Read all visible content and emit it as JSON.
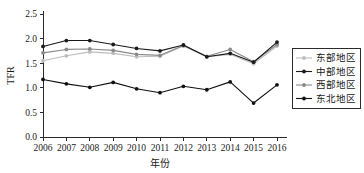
{
  "chart_data": {
    "type": "line",
    "title": "",
    "xlabel": "年份",
    "ylabel": "TFR",
    "x": [
      "2006",
      "2007",
      "2008",
      "2009",
      "2010",
      "2011",
      "2012",
      "2013",
      "2014",
      "2015",
      "2016"
    ],
    "xtick_labels": [
      "2006",
      "2007",
      "2008",
      "2009",
      "2010",
      "2011",
      "2012",
      "2013",
      "2014",
      "2015",
      "2016"
    ],
    "ytick_labels": [
      "0.0",
      "0.5",
      "1.0",
      "1.5",
      "2.0",
      "2.5"
    ],
    "ytick_values": [
      0.0,
      0.5,
      1.0,
      1.5,
      2.0,
      2.5
    ],
    "ylim": [
      0.0,
      2.5
    ],
    "grid": false,
    "legend_position": "right",
    "series": [
      {
        "name": "东部地区",
        "color": "#bdbdbd",
        "values": [
          1.55,
          1.65,
          1.73,
          1.7,
          1.63,
          1.64,
          1.85,
          1.63,
          1.68,
          1.49,
          1.85
        ]
      },
      {
        "name": "中部地区",
        "color": "#1a1a1a",
        "values": [
          1.84,
          1.96,
          1.96,
          1.88,
          1.8,
          1.75,
          1.87,
          1.63,
          1.7,
          1.52,
          1.93
        ]
      },
      {
        "name": "西部地区",
        "color": "#8a8a8a",
        "values": [
          1.71,
          1.78,
          1.79,
          1.76,
          1.68,
          1.66,
          1.86,
          1.64,
          1.78,
          1.53,
          1.88
        ]
      },
      {
        "name": "东北地区",
        "color": "#111111",
        "values": [
          1.17,
          1.08,
          1.01,
          1.11,
          0.98,
          0.9,
          1.03,
          0.96,
          1.12,
          0.69,
          1.06
        ]
      }
    ]
  },
  "legend": {
    "items": [
      {
        "label": "东部地区"
      },
      {
        "label": "中部地区"
      },
      {
        "label": "西部地区"
      },
      {
        "label": "东北地区"
      }
    ]
  },
  "axes": {
    "y_title": "TFR",
    "x_title": "年份"
  }
}
